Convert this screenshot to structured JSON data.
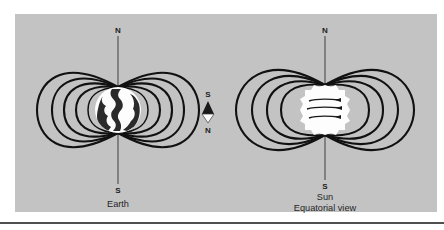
{
  "figure": {
    "background_color": "#c3c3c3",
    "page_color": "#ffffff",
    "line_color": "#111111",
    "panel": {
      "x": 15,
      "y": 14,
      "width": 422,
      "height": 198
    },
    "footer_rule": {
      "y": 223,
      "x1": 0,
      "x2": 444,
      "color": "#151515"
    }
  },
  "earth": {
    "label": "Earth",
    "north_pole_label": "N",
    "south_pole_label": "S",
    "center": {
      "x": 118,
      "y": 110
    },
    "radius": 23,
    "axis_top_y": 36,
    "axis_bottom_y": 184,
    "loop_count": 5,
    "loop_widths": [
      31,
      48,
      63,
      77,
      90
    ],
    "loop_heights": [
      34,
      50,
      62,
      72,
      80
    ],
    "disc_fill": "#fdfdfd",
    "continent_fill": "#2b2b2b"
  },
  "compass": {
    "name": "compass-needle",
    "south_label": "S",
    "north_label": "N",
    "center": {
      "x": 208,
      "y": 112
    },
    "dark_half": "north-pointing-dark-triangle",
    "light_half": "south-pointing-light-triangle"
  },
  "sun": {
    "label": "Sun",
    "view_label": "Equatorial view",
    "north_pole_label": "N",
    "south_pole_label": "S",
    "center": {
      "x": 325,
      "y": 110
    },
    "radius": 25,
    "axis_top_y": 36,
    "axis_bottom_y": 180,
    "loop_count": 4,
    "loop_widths": [
      38,
      58,
      76,
      93
    ],
    "loop_heights": [
      40,
      56,
      68,
      78
    ],
    "disc_fill": "#fdfdfd",
    "band_count": 3,
    "band_description": "three curved rotation arrows pointing right"
  }
}
